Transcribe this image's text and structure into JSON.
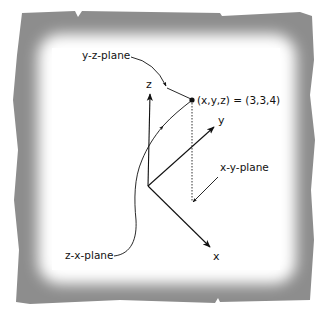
{
  "diagram": {
    "type": "3d-coordinate-system",
    "frame": {
      "style": "torn-paper-gray-vignette",
      "colors": {
        "outer": "#8a8a8a",
        "inner": "#ffffff",
        "ink": "#111111"
      }
    },
    "axes": [
      {
        "name": "z",
        "label": "z"
      },
      {
        "name": "y",
        "label": "y"
      },
      {
        "name": "x",
        "label": "x"
      }
    ],
    "point": {
      "label": "(x,y,z) = (3,3,4)",
      "coords": [
        3,
        3,
        4
      ]
    },
    "plane_labels": {
      "yz": "y-z-plane",
      "xy": "x-y-plane",
      "zx": "z-x-plane"
    }
  }
}
